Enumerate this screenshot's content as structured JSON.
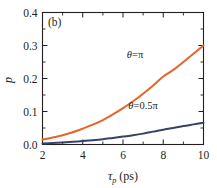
{
  "chart_data": {
    "type": "line",
    "title": "",
    "panel_label": "(b)",
    "xlabel": "τp (ps)",
    "xlabel_base": "τ",
    "xlabel_sub": "p",
    "xlabel_unit": " (ps)",
    "ylabel": "p",
    "xlim": [
      2,
      10
    ],
    "ylim": [
      0.0,
      0.4
    ],
    "xticks": [
      2,
      4,
      6,
      8,
      10
    ],
    "xtick_labels": [
      "2",
      "4",
      "6",
      "8",
      "10"
    ],
    "xticks_minor": [
      3,
      5,
      7,
      9
    ],
    "yticks": [
      0.0,
      0.1,
      0.2,
      0.3,
      0.4
    ],
    "ytick_labels": [
      "0.0",
      "0.1",
      "0.2",
      "0.3",
      "0.4"
    ],
    "yticks_minor": [
      0.05,
      0.15,
      0.25,
      0.35
    ],
    "grid": false,
    "legend_position": "inline-annotations",
    "series": [
      {
        "name": "θ=π",
        "color": "#E8622A",
        "linewidth": 2.0,
        "label_text": "θ=π",
        "label_x": 6.6,
        "label_y": 0.262,
        "x": [
          2,
          2.5,
          3,
          3.5,
          4,
          4.5,
          5,
          5.5,
          6,
          6.5,
          7,
          7.5,
          8,
          8.5,
          9,
          9.5,
          10
        ],
        "values": [
          0.015,
          0.021,
          0.028,
          0.037,
          0.048,
          0.06,
          0.074,
          0.091,
          0.11,
          0.131,
          0.154,
          0.179,
          0.206,
          0.226,
          0.25,
          0.275,
          0.3
        ]
      },
      {
        "name": "θ=0.5π",
        "color": "#3B3F6B",
        "linewidth": 2.0,
        "label_text": "θ=0.5π",
        "label_x": 7.0,
        "label_y": 0.107,
        "x": [
          2,
          2.5,
          3,
          3.5,
          4,
          4.5,
          5,
          5.5,
          6,
          6.5,
          7,
          7.5,
          8,
          8.5,
          9,
          9.5,
          10
        ],
        "values": [
          0.003,
          0.0045,
          0.006,
          0.008,
          0.0105,
          0.013,
          0.016,
          0.02,
          0.024,
          0.028,
          0.033,
          0.039,
          0.045,
          0.05,
          0.056,
          0.061,
          0.066
        ]
      }
    ]
  },
  "colors": {
    "axis": "#231f20",
    "background": "#ffffff",
    "series_theta_pi": "#E8622A",
    "series_theta_half_pi": "#3B3F6B"
  }
}
